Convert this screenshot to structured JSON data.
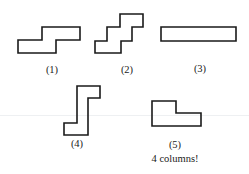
{
  "figure": {
    "stroke_color": "#1a1a1a",
    "shapes": [
      {
        "id": 1,
        "label": "(1)",
        "points": "42,27 80,27 80,40 56,40 56,53 18,53 18,40 42,40",
        "label_x": 52,
        "label_y": 65
      },
      {
        "id": 2,
        "label": "(2)",
        "points": "120,14 143,14 143,27 132,27 132,41 121,41 121,53 95,53 95,41 107,41 107,27 120,27",
        "label_x": 127,
        "label_y": 65
      },
      {
        "id": 3,
        "label": "(3)",
        "points": "161,27 236,27 236,41 161,41",
        "label_x": 200,
        "label_y": 64
      },
      {
        "id": 4,
        "label": "(4)",
        "points": "77,86 100,86 100,98 88,98 88,135 64,135 64,123 77,123",
        "label_x": 77,
        "label_y": 139
      },
      {
        "id": 5,
        "label": "(5)",
        "points": "152,101 176,101 176,113 201,113 201,126 152,126",
        "label_x": 175,
        "label_y": 140
      }
    ],
    "caption": "4 columns!",
    "caption_x": 175,
    "caption_y": 154
  }
}
